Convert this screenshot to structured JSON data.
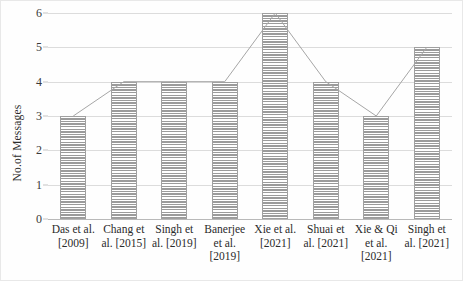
{
  "chart_data": {
    "type": "bar",
    "title": "",
    "xlabel": "",
    "ylabel": "No.of Messages",
    "categories": [
      "Das et al. [2009]",
      "Chang et al. [2015]",
      "Singh et al. [2019]",
      "Banerjee et al. [2019]",
      "Xie et al. [2021]",
      "Shuai et al. [2021]",
      "Xie & Qi et al. [2021]",
      "Singh et al. [2021]"
    ],
    "category_lines": [
      [
        "Das et al.",
        "[2009]"
      ],
      [
        "Chang et",
        "al. [2015]"
      ],
      [
        "Singh et",
        "al. [2019]"
      ],
      [
        "Banerjee",
        "et al.",
        "[2019]"
      ],
      [
        "Xie et al.",
        "[2021]"
      ],
      [
        "Shuai et",
        "al. [2021]"
      ],
      [
        "Xie & Qi",
        "et al.",
        "[2021]"
      ],
      [
        "Singh et",
        "al. [2021]"
      ]
    ],
    "values": [
      3,
      4,
      4,
      4,
      6,
      4,
      3,
      5
    ],
    "ylim": [
      0,
      6
    ],
    "yticks": [
      0,
      1,
      2,
      3,
      4,
      5,
      6
    ],
    "grid": true,
    "legend": "none",
    "has_line_overlay": true,
    "bar_fill": "#a5a5a5",
    "bar_hatch": "horizontal-lines",
    "line_color": "#a6a6a6",
    "grid_color": "#dcdcdc"
  }
}
